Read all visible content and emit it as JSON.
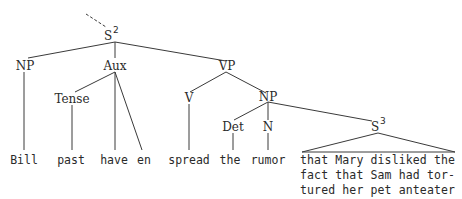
{
  "tree": {
    "root": {
      "label": "S",
      "sup": "2"
    },
    "nodes": {
      "np_subj": "NP",
      "aux": "Aux",
      "vp": "VP",
      "tense": "Tense",
      "v": "V",
      "np_obj": "NP",
      "det": "Det",
      "n": "N",
      "s3": {
        "label": "S",
        "sup": "3"
      }
    },
    "leaves": {
      "bill": "Bill",
      "past": "past",
      "have": "have",
      "en": "en",
      "spread": "spread",
      "the": "the",
      "rumor": "rumor",
      "clause_lines": [
        "that Mary disliked the",
        "fact that Sam had tor-",
        "tured her pet anteater"
      ]
    }
  }
}
